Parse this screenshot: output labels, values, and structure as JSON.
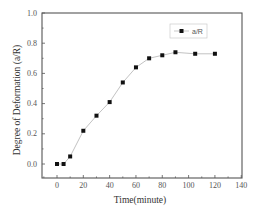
{
  "chart_data": {
    "type": "line",
    "title": "",
    "xlabel": "Time(minute)",
    "ylabel": "Degree of Deformation (a/R)",
    "xlim": [
      -10,
      140
    ],
    "ylim": [
      -0.08,
      1.0
    ],
    "xticks": [
      0,
      20,
      40,
      60,
      80,
      100,
      120,
      140
    ],
    "yticks": [
      0.0,
      0.2,
      0.4,
      0.6,
      0.8,
      1.0
    ],
    "ytick_labels": [
      "0.0",
      "0.2",
      "0.4",
      "0.6",
      "0.8",
      "1.0"
    ],
    "grid": false,
    "legend_position": "upper right",
    "series": [
      {
        "name": "a/R",
        "marker": "square",
        "color": "#111111",
        "line_color": "#bbbbbb",
        "x": [
          0,
          5,
          10,
          20,
          30,
          40,
          50,
          60,
          70,
          80,
          90,
          105,
          120
        ],
        "values": [
          0.0,
          0.0,
          0.05,
          0.22,
          0.32,
          0.41,
          0.54,
          0.64,
          0.7,
          0.72,
          0.74,
          0.73,
          0.73
        ]
      }
    ]
  },
  "colors": {
    "axis": "#555555",
    "marker": "#111111",
    "line": "#bbbbbb",
    "legend_border": "#cccccc"
  }
}
